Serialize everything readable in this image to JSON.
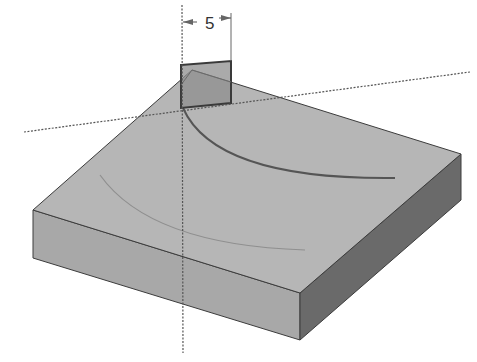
{
  "figure": {
    "dimension": {
      "value": "5"
    },
    "colors": {
      "background": "#ffffff",
      "top_face": "#b4b4b4",
      "front_face": "#a6a6a6",
      "side_face": "#6a6a6a",
      "sketch_plane": "#8e8e8e",
      "edge": "#3c3c3c",
      "axis_line": "#555555",
      "arc_dark": "#555555",
      "arc_faint": "#9a9a9a"
    }
  }
}
